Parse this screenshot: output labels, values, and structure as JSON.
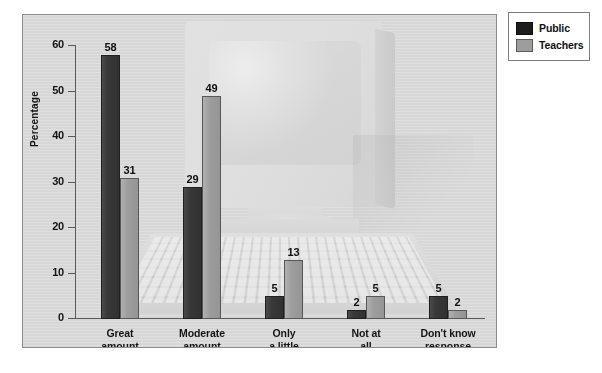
{
  "chart_data": {
    "type": "bar",
    "title": "",
    "xlabel": "",
    "ylabel": "Percentage",
    "ylim": [
      0,
      60
    ],
    "yticks": [
      0,
      10,
      20,
      30,
      40,
      50,
      60
    ],
    "ytick_labels": [
      "0",
      "10",
      "20",
      "30",
      "40",
      "50",
      "60"
    ],
    "grid": false,
    "legend_position": "top-right",
    "categories": [
      "Great\namount",
      "Moderate\namount",
      "Only\na little",
      "Not at\nall",
      "Don't know\nresponse"
    ],
    "series": [
      {
        "name": "Public",
        "color": "#333333",
        "values": [
          58,
          29,
          5,
          2,
          5
        ]
      },
      {
        "name": "Teachers",
        "color": "#9d9d9d",
        "values": [
          31,
          49,
          13,
          5,
          2
        ]
      }
    ],
    "annotations": "Background watermark shows a faded desktop computer monitor, tower and keyboard."
  },
  "legend": {
    "items": [
      {
        "label": "Public",
        "swatch": "public"
      },
      {
        "label": "Teachers",
        "swatch": "teachers"
      }
    ]
  },
  "watermark": {
    "name": "desktop-computer-illustration"
  }
}
